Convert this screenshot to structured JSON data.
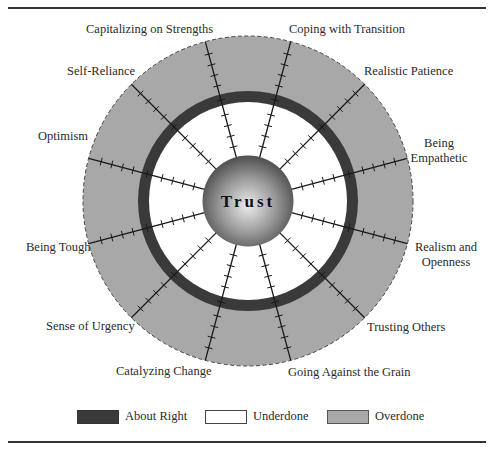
{
  "diagram": {
    "center_label": "Trust",
    "competencies": [
      {
        "label": "Coping with Transition",
        "angle_deg": 15
      },
      {
        "label": "Realistic Patience",
        "angle_deg": 45
      },
      {
        "label": "Being Empathetic",
        "angle_deg": 75
      },
      {
        "label": "Realism and Openness",
        "angle_deg": 105
      },
      {
        "label": "Trusting Others",
        "angle_deg": 135
      },
      {
        "label": "Going Against the Grain",
        "angle_deg": 165
      },
      {
        "label": "Catalyzing Change",
        "angle_deg": 195
      },
      {
        "label": "Sense of Urgency",
        "angle_deg": 225
      },
      {
        "label": "Being Tough",
        "angle_deg": 255
      },
      {
        "label": "Optimism",
        "angle_deg": 285
      },
      {
        "label": "Self-Reliance",
        "angle_deg": 315
      },
      {
        "label": "Capitalizing on Strengths",
        "angle_deg": 345
      }
    ],
    "label_lines": {
      "being_empathetic_1": "Being",
      "being_empathetic_2": "Empathetic",
      "realism_1": "Realism and",
      "realism_2": "Openness"
    },
    "zones": {
      "inner": "Underdone",
      "ring": "About Right",
      "outer": "Overdone"
    },
    "colors": {
      "about_right": "#3a3a3a",
      "underdone": "#ffffff",
      "overdone": "#a8a8a8",
      "sphere_light": "#e8e8e8",
      "sphere_dark": "#555555",
      "spoke": "#1a1a1a"
    }
  },
  "legend": {
    "items": [
      {
        "label": "About Right",
        "color": "#3a3a3a"
      },
      {
        "label": "Underdone",
        "color": "#ffffff"
      },
      {
        "label": "Overdone",
        "color": "#a8a8a8"
      }
    ]
  }
}
